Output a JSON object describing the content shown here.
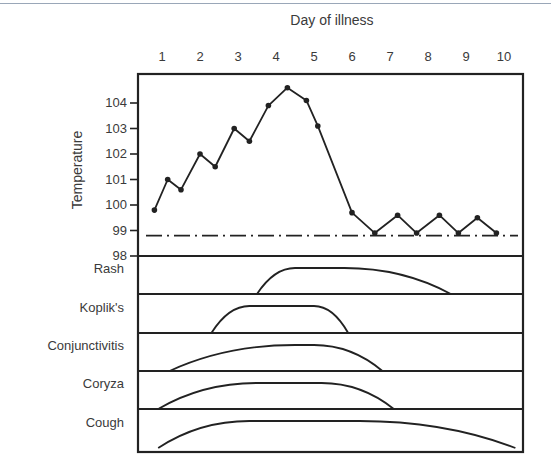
{
  "chart_data": {
    "type": "line",
    "title": "Day of illness",
    "xlabel": "Day of illness",
    "ylabel": "Temperature",
    "x_ticks": [
      "1",
      "2",
      "3",
      "4",
      "5",
      "6",
      "7",
      "8",
      "9",
      "10"
    ],
    "y_ticks": [
      "104",
      "103",
      "102",
      "101",
      "100",
      "99",
      "98"
    ],
    "ylim": [
      98,
      104.7
    ],
    "grid": false,
    "legend": null,
    "series": [
      {
        "name": "Temperature",
        "x": [
          0.8,
          1.15,
          1.5,
          2.0,
          2.4,
          2.9,
          3.3,
          3.8,
          4.3,
          4.8,
          5.1,
          6.0,
          6.6,
          7.2,
          7.7,
          8.3,
          8.8,
          9.3,
          9.8
        ],
        "values": [
          99.8,
          101.0,
          100.6,
          102.0,
          101.5,
          103.0,
          102.5,
          103.9,
          104.6,
          104.1,
          103.1,
          99.7,
          98.9,
          99.6,
          98.9,
          99.6,
          98.9,
          99.5,
          98.9
        ]
      },
      {
        "name": "Normal baseline",
        "style": "dash-dot",
        "values": [
          98.8
        ]
      }
    ],
    "symptom_rows": [
      {
        "name": "Rash",
        "start_day": 3.5,
        "peak_start_day": 4.5,
        "peak_end_day": 5.8,
        "end_day": 8.6
      },
      {
        "name": "Koplik's",
        "start_day": 2.3,
        "peak_start_day": 3.3,
        "peak_end_day": 5.0,
        "end_day": 5.9
      },
      {
        "name": "Conjunctivitis",
        "start_day": 1.2,
        "peak_start_day": 4.5,
        "peak_end_day": 5.0,
        "end_day": 6.8
      },
      {
        "name": "Coryza",
        "start_day": 0.9,
        "peak_start_day": 3.5,
        "peak_end_day": 5.2,
        "end_day": 7.1
      },
      {
        "name": "Cough",
        "start_day": 0.9,
        "peak_start_day": 3.3,
        "peak_end_day": 6.2,
        "end_day": 10.3
      }
    ]
  },
  "labels": {
    "x_title": "Day of illness",
    "y_title": "Temperature",
    "rows": [
      "Rash",
      "Koplik's",
      "Conjunctivitis",
      "Coryza",
      "Cough"
    ]
  }
}
